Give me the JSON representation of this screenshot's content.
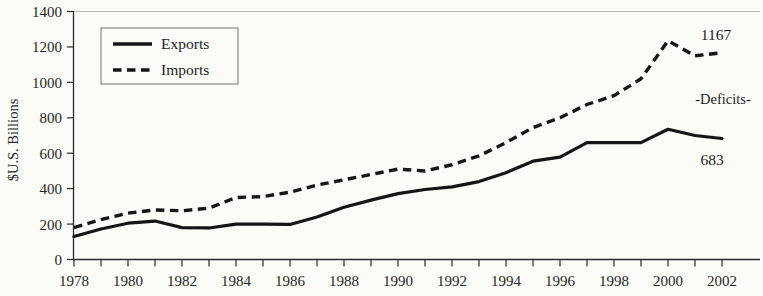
{
  "chart_data": {
    "type": "line",
    "title": "",
    "xlabel": "",
    "ylabel": "$U.S. Billions",
    "xlim": [
      1978,
      2002
    ],
    "ylim": [
      0,
      1400
    ],
    "ytick_step": 200,
    "xtick_step": 1,
    "xtick_label_step": 2,
    "grid": false,
    "legend_position": "top-left",
    "x": [
      1978,
      1979,
      1980,
      1981,
      1982,
      1983,
      1984,
      1985,
      1986,
      1987,
      1988,
      1989,
      1990,
      1991,
      1992,
      1993,
      1994,
      1995,
      1996,
      1997,
      1998,
      1999,
      2000,
      2001,
      2002
    ],
    "xticklabels": [
      "1978",
      "",
      "1980",
      "",
      "1982",
      "",
      "1984",
      "",
      "1986",
      "",
      "1988",
      "",
      "1990",
      "",
      "1992",
      "",
      "1994",
      "",
      "1996",
      "",
      "1998",
      "",
      "2000",
      "",
      "2002"
    ],
    "yticklabels": [
      "0",
      "200",
      "400",
      "600",
      "800",
      "1000",
      "1200",
      "1400"
    ],
    "series": [
      {
        "name": "Exports",
        "style": "solid",
        "color": "#151515",
        "values": [
          130,
          172,
          205,
          217,
          180,
          178,
          200,
          200,
          198,
          240,
          295,
          335,
          372,
          395,
          410,
          440,
          490,
          555,
          578,
          660,
          660,
          660,
          735,
          700,
          683
        ]
      },
      {
        "name": "Imports",
        "style": "dashed",
        "color": "#151515",
        "values": [
          180,
          225,
          262,
          280,
          275,
          290,
          350,
          355,
          380,
          420,
          450,
          480,
          510,
          500,
          535,
          585,
          660,
          745,
          800,
          875,
          925,
          1020,
          1235,
          1150,
          1167
        ]
      }
    ],
    "annotations": [
      {
        "text": "1167",
        "series": "Imports",
        "x": 2002,
        "value": 1167
      },
      {
        "text": "683",
        "series": "Exports",
        "x": 2002,
        "value": 683
      },
      {
        "text": "-Deficits-",
        "series": "",
        "x": 2000,
        "value": 880
      }
    ]
  },
  "legend": {
    "entries": [
      {
        "label": "Exports",
        "style": "solid"
      },
      {
        "label": "Imports",
        "style": "dashed"
      }
    ]
  }
}
